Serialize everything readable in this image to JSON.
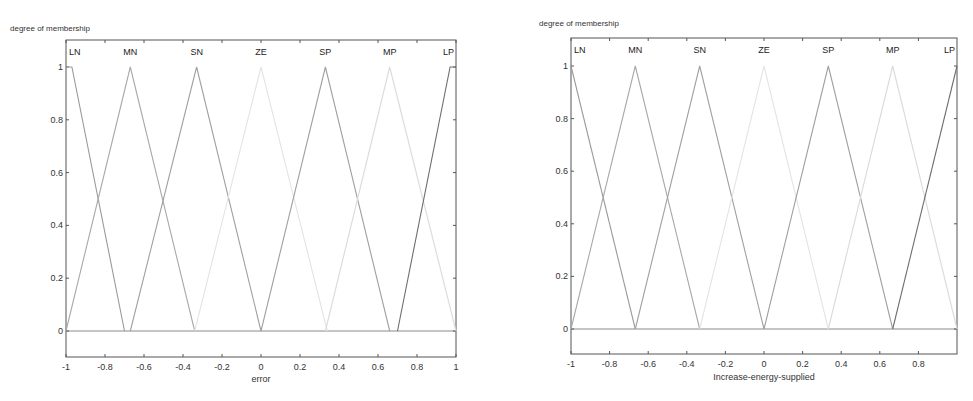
{
  "chart_data": [
    {
      "type": "line",
      "title": "",
      "ylabel": "degree of membership",
      "xlabel": "error",
      "xlim": [
        -1,
        1
      ],
      "ylim": [
        -0.1,
        1.1
      ],
      "xticks": [
        "-1",
        "-0.8",
        "-0.6",
        "-0.4",
        "-0.2",
        "0",
        "0.2",
        "0.4",
        "0.6",
        "0.8",
        "1"
      ],
      "yticks": [
        "0",
        "0.2",
        "0.4",
        "0.6",
        "0.8",
        "1"
      ],
      "grid": false,
      "legend": "inline labels at top",
      "series": [
        {
          "name": "LN",
          "color": "#9a9a9a",
          "x": [
            -1,
            -0.97,
            -0.7
          ],
          "y": [
            1,
            1,
            0
          ]
        },
        {
          "name": "MN",
          "color": "#a8a8a8",
          "x": [
            -1,
            -0.67,
            -0.34
          ],
          "y": [
            0,
            1,
            0
          ]
        },
        {
          "name": "SN",
          "color": "#a0a0a0",
          "x": [
            -0.67,
            -0.33,
            0
          ],
          "y": [
            0,
            1,
            0
          ]
        },
        {
          "name": "ZE",
          "color": "#e4e4e4",
          "x": [
            -0.34,
            0,
            0.34
          ],
          "y": [
            0,
            1,
            0
          ]
        },
        {
          "name": "SP",
          "color": "#a0a0a0",
          "x": [
            0,
            0.33,
            0.66
          ],
          "y": [
            0,
            1,
            0
          ]
        },
        {
          "name": "MP",
          "color": "#dadada",
          "x": [
            0.33,
            0.66,
            1
          ],
          "y": [
            0,
            1,
            0
          ]
        },
        {
          "name": "LP",
          "color": "#6e6e6e",
          "x": [
            0.7,
            0.97,
            1
          ],
          "y": [
            0,
            1,
            1
          ]
        }
      ]
    },
    {
      "type": "line",
      "title": "",
      "ylabel": "degree of membership",
      "xlabel": "Increase-energy-supplied",
      "xlim": [
        -1,
        1
      ],
      "ylim": [
        -0.1,
        1.1
      ],
      "xticks": [
        "-1",
        "-0.8",
        "-0.6",
        "-0.4",
        "-0.2",
        "0",
        "0.2",
        "0.4",
        "0.6",
        "0.8"
      ],
      "yticks": [
        "0",
        "0.2",
        "0.4",
        "0.6",
        "0.8",
        "1"
      ],
      "grid": false,
      "legend": "inline labels at top",
      "series": [
        {
          "name": "LN",
          "color": "#9a9a9a",
          "x": [
            -1,
            -0.667
          ],
          "y": [
            1,
            0
          ]
        },
        {
          "name": "MN",
          "color": "#a8a8a8",
          "x": [
            -1,
            -0.667,
            -0.333
          ],
          "y": [
            0,
            1,
            0
          ]
        },
        {
          "name": "SN",
          "color": "#a0a0a0",
          "x": [
            -0.667,
            -0.333,
            0
          ],
          "y": [
            0,
            1,
            0
          ]
        },
        {
          "name": "ZE",
          "color": "#e4e4e4",
          "x": [
            -0.333,
            0,
            0.333
          ],
          "y": [
            0,
            1,
            0
          ]
        },
        {
          "name": "SP",
          "color": "#a0a0a0",
          "x": [
            0,
            0.333,
            0.667
          ],
          "y": [
            0,
            1,
            0
          ]
        },
        {
          "name": "MP",
          "color": "#dadada",
          "x": [
            0.333,
            0.667,
            1
          ],
          "y": [
            0,
            1,
            0
          ]
        },
        {
          "name": "LP",
          "color": "#6e6e6e",
          "x": [
            0.667,
            1
          ],
          "y": [
            0,
            1
          ]
        }
      ]
    }
  ],
  "layout": [
    {
      "box": {
        "left": 66,
        "right": 456,
        "top": 40,
        "bottom": 357
      },
      "y0px": 331,
      "y1px": 67,
      "ylabel_pos": {
        "x": 10,
        "y": 24
      },
      "xlabel_pos": {
        "x": 261,
        "y": 374
      },
      "mf_label_y": 55
    },
    {
      "box": {
        "left": 571,
        "right": 957,
        "top": 38,
        "bottom": 354
      },
      "y0px": 329,
      "y1px": 66,
      "ylabel_pos": {
        "x": 539,
        "y": 19
      },
      "xlabel_pos": {
        "x": 764,
        "y": 372
      },
      "mf_label_y": 53
    }
  ]
}
